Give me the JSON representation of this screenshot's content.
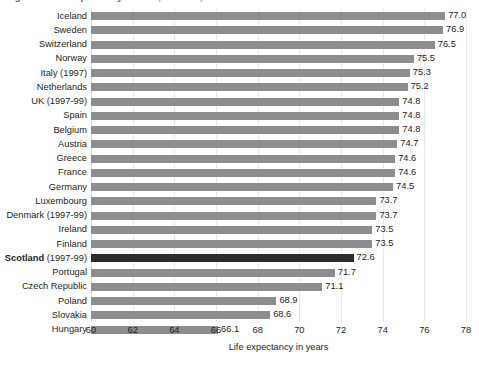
{
  "chart": {
    "title": "Figure 1: Life expectancy at birth, females, 1998",
    "axis_title": "Life expectancy in years"
  },
  "chart_data": {
    "type": "bar",
    "orientation": "horizontal",
    "title": "Figure 1: Life expectancy at birth, females, 1998",
    "xlabel": "Life expectancy in years",
    "ylabel": "",
    "xlim": [
      60,
      78
    ],
    "xticks": [
      60,
      62,
      64,
      66,
      68,
      70,
      72,
      74,
      76,
      78
    ],
    "grid": "vertical",
    "legend": "none",
    "bar_color": "#8d8d8f",
    "highlight_color": "#2b2b2b",
    "highlight_category": "Scotland (1997-99)",
    "categories": [
      "Iceland",
      "Sweden",
      "Switzerland",
      "Norway",
      "Italy (1997)",
      "Netherlands",
      "UK (1997-99)",
      "Spain",
      "Belgium",
      "Austria",
      "Greece",
      "France",
      "Germany",
      "Luxembourg",
      "Denmark (1997-99)",
      "Ireland",
      "Finland",
      "Scotland (1997-99)",
      "Portugal",
      "Czech Republic",
      "Poland",
      "Slovakia",
      "Hungary"
    ],
    "values": [
      77.0,
      76.9,
      76.5,
      75.5,
      75.3,
      75.2,
      74.8,
      74.8,
      74.8,
      74.7,
      74.6,
      74.6,
      74.5,
      73.7,
      73.7,
      73.5,
      73.5,
      72.6,
      71.7,
      71.1,
      68.9,
      68.6,
      66.1
    ],
    "value_labels": [
      "77.0",
      "76.9",
      "76.5",
      "75.5",
      "75.3",
      "75.2",
      "74.8",
      "74.8",
      "74.8",
      "74.7",
      "74.6",
      "74.6",
      "74.5",
      "73.7",
      "73.7",
      "73.5",
      "73.5",
      "72.6",
      "71.7",
      "71.1",
      "68.9",
      "68.6",
      "66.1"
    ],
    "bold_label_prefix": "Scotland",
    "bold_label_suffix": " (1997-99)"
  }
}
